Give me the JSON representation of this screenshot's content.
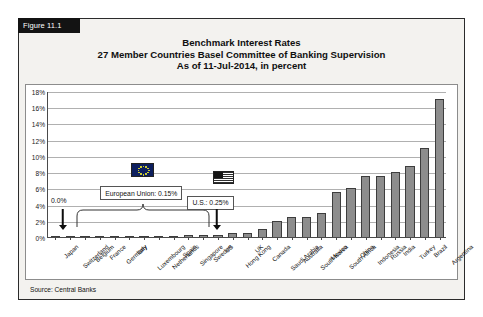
{
  "figure": {
    "tab_label": "Figure 11.1",
    "source": "Source: Central Banks"
  },
  "title": {
    "line1": "Benchmark Interest Rates",
    "line2": "27 Member Countries Basel Committee of Banking Supervision",
    "line3": "As of 11-Jul-2014, in percent"
  },
  "annotations": {
    "zero_label": "0.0%",
    "eu_callout": "European Union: 0.15%",
    "us_callout": "U.S.: 0.25%",
    "eu_flag_name": "european-union-flag",
    "us_flag_name": "united-states-flag"
  },
  "colors": {
    "bar_fill": "#8d8d8d",
    "bar_border": "#3d3d3d",
    "grid": "#b0b0b0",
    "axis": "#4a4a4a",
    "frame_bg": "#f3f2ef",
    "tab_bg": "#131313"
  },
  "chart_data": {
    "type": "bar",
    "xlabel": "",
    "ylabel": "",
    "ylim": [
      0,
      18
    ],
    "ytick_labels": [
      "0%",
      "2%",
      "4%",
      "6%",
      "8%",
      "10%",
      "12%",
      "14%",
      "16%",
      "18%"
    ],
    "ytick_values": [
      0,
      2,
      4,
      6,
      8,
      10,
      12,
      14,
      16,
      18
    ],
    "grid": true,
    "legend": "none",
    "categories": [
      "Japan",
      "Switzerland",
      "Belgium",
      "France",
      "Germany",
      "Italy",
      "Luxembourg",
      "Netherlands",
      "Spain",
      "Singapore",
      "Sweden",
      "US",
      "Hong Kong",
      "UK",
      "Canada",
      "Saudi Arabia",
      "Australia",
      "South Korea",
      "Mexico",
      "South Africa",
      "China",
      "Indonesia",
      "Russia",
      "India",
      "Turkey",
      "Brazil",
      "Argentina"
    ],
    "values": [
      0.0,
      0.0,
      0.15,
      0.15,
      0.15,
      0.15,
      0.15,
      0.15,
      0.15,
      0.2,
      0.25,
      0.25,
      0.5,
      0.5,
      1.0,
      2.0,
      2.5,
      2.5,
      3.0,
      5.5,
      6.0,
      7.5,
      7.5,
      8.0,
      8.75,
      11.0,
      17.0
    ]
  }
}
